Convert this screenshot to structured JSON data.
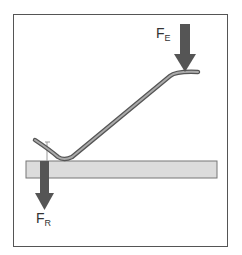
{
  "diagram": {
    "type": "lever-force-diagram",
    "labels": {
      "effort_force": {
        "main": "F",
        "sub": "E"
      },
      "resistance_force": {
        "main": "F",
        "sub": "R"
      }
    },
    "colors": {
      "arrow": "#555555",
      "board": "#dcdcdc",
      "board_border": "#777777",
      "lever": "#888888",
      "frame": "#555555"
    }
  }
}
